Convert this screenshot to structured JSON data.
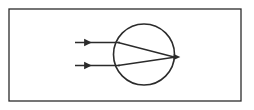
{
  "figure": {
    "kind": "optics-ray-diagram",
    "canvas": {
      "width": 254,
      "height": 110,
      "background": "#ffffff"
    }
  },
  "frame": {
    "label": "figure-border",
    "x": 9,
    "y": 9,
    "width": 232,
    "height": 92,
    "stroke": "#2b2b2b",
    "stroke_width": 1.3,
    "fill": "#ffffff"
  },
  "lens": {
    "label": "lens-circle",
    "shape": "circle",
    "center_x": 144,
    "center_y": 54.5,
    "radius": 30.5,
    "stroke": "#2b2b2b",
    "stroke_width": 1.6,
    "fill": "none"
  },
  "focal_point": {
    "label": "focal-point",
    "x": 175,
    "y": 57,
    "marker": "arrowhead"
  },
  "rays": [
    {
      "name": "upper-incident-ray",
      "role": "incident",
      "x1": 75,
      "y1": 42.5,
      "x2": 120,
      "y2": 42.5,
      "stroke": "#2b2b2b",
      "stroke_width": 1.4,
      "arrow_at": "midpoint",
      "arrow_x": 88,
      "arrow_y": 42.5
    },
    {
      "name": "lower-incident-ray",
      "role": "incident",
      "x1": 75,
      "y1": 65.5,
      "x2": 120,
      "y2": 65.5,
      "stroke": "#2b2b2b",
      "stroke_width": 1.4,
      "arrow_at": "midpoint",
      "arrow_x": 88,
      "arrow_y": 65.5
    },
    {
      "name": "upper-refracted-ray",
      "role": "refracted",
      "x1": 118,
      "y1": 42.5,
      "x2": 176,
      "y2": 57.5,
      "stroke": "#2b2b2b",
      "stroke_width": 1.3
    },
    {
      "name": "lower-refracted-ray",
      "role": "refracted",
      "x1": 118,
      "y1": 65.5,
      "x2": 176,
      "y2": 57.0,
      "stroke": "#2b2b2b",
      "stroke_width": 1.3
    }
  ],
  "arrowheads": [
    {
      "name": "upper-ray-arrowhead",
      "x": 88,
      "y": 42.5,
      "size": 7,
      "fill": "#2b2b2b"
    },
    {
      "name": "lower-ray-arrowhead",
      "x": 88,
      "y": 65.5,
      "size": 7,
      "fill": "#2b2b2b"
    },
    {
      "name": "focal-point-arrowhead",
      "x": 177,
      "y": 57,
      "size": 6,
      "fill": "#2b2b2b"
    }
  ],
  "labels": {
    "caption": "",
    "axis_label": "",
    "annotations": []
  }
}
